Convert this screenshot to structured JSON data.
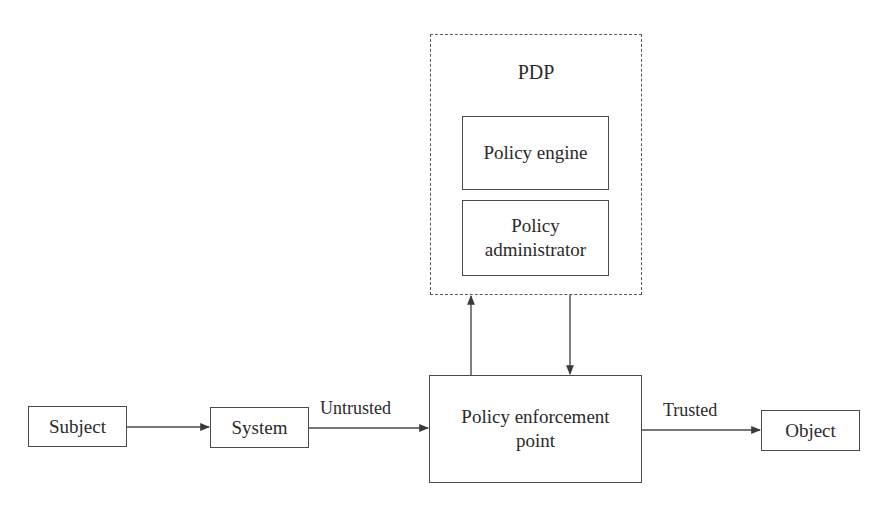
{
  "diagram": {
    "type": "flowchart",
    "nodes": {
      "subject": {
        "label": "Subject"
      },
      "system": {
        "label": "System"
      },
      "pep": {
        "label_line1": "Policy enforcement",
        "label_line2": "point"
      },
      "object": {
        "label": "Object"
      },
      "pdp": {
        "title": "PDP",
        "children": {
          "policy_engine": {
            "label": "Policy engine"
          },
          "policy_administrator": {
            "label_line1": "Policy",
            "label_line2": "administrator"
          }
        }
      }
    },
    "edges": [
      {
        "from": "Subject",
        "to": "System",
        "label": ""
      },
      {
        "from": "System",
        "to": "Policy enforcement point",
        "label": "Untrusted"
      },
      {
        "from": "Policy enforcement point",
        "to": "Object",
        "label": "Trusted"
      },
      {
        "from": "Policy enforcement point",
        "to": "PDP",
        "label": ""
      },
      {
        "from": "PDP",
        "to": "Policy enforcement point",
        "label": ""
      }
    ],
    "edge_labels": {
      "untrusted": "Untrusted",
      "trusted": "Trusted"
    },
    "colors": {
      "stroke": "#4a4a4a",
      "text": "#2a2a2a",
      "background": "#ffffff"
    }
  }
}
